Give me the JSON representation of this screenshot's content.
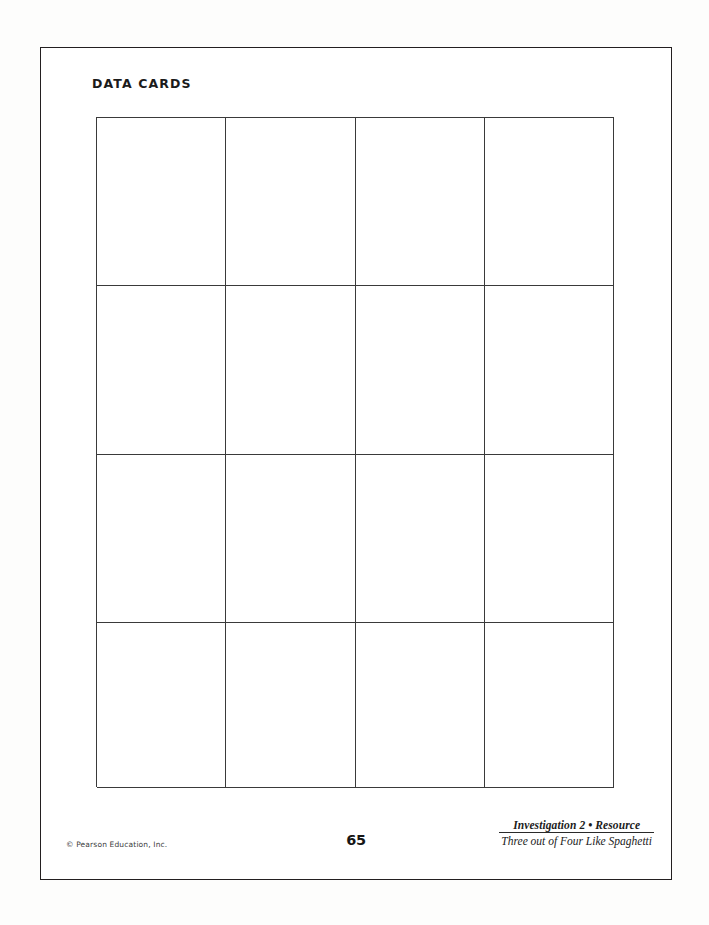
{
  "page": {
    "title": "DATA CARDS",
    "page_number": "65",
    "background_color": "#fdfdfc",
    "ink_color": "#231f20"
  },
  "grid": {
    "columns": 4,
    "rows": 4,
    "total_cells": 16,
    "cells": [
      "",
      "",
      "",
      "",
      "",
      "",
      "",
      "",
      "",
      "",
      "",
      "",
      "",
      "",
      "",
      ""
    ]
  },
  "footer": {
    "copyright": "© Pearson Education, Inc.",
    "page_number": "65",
    "source_line1": "Investigation 2 • Resource",
    "source_line2": "Three out of Four Like Spaghetti"
  }
}
